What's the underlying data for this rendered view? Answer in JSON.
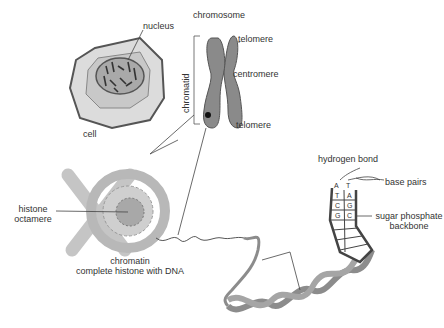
{
  "diagram": {
    "labels": {
      "nucleus": "nucleus",
      "cell": "cell",
      "chromosome": "chromosome",
      "chromatid": "chromatid",
      "telomere_top": "telomere",
      "centromere": "centromere",
      "telomere_bottom": "telomere",
      "histone_line1": "histone",
      "histone_line2": "octamere",
      "chromatin_line1": "chromatin",
      "chromatin_line2": "complete histone with DNA",
      "hydrogen_bond": "hydrogen bond",
      "base_pairs": "base pairs",
      "sugar_line1": "sugar phosphate",
      "sugar_line2": "backbone"
    },
    "base_pairs": [
      {
        "left": "A",
        "right": "T"
      },
      {
        "left": "T",
        "right": "A"
      },
      {
        "left": "C",
        "right": "G"
      },
      {
        "left": "G",
        "right": "C"
      }
    ],
    "colors": {
      "line": "#444444",
      "cell_fill": "#d9d9d9",
      "nucleus_fill": "#a8a8a8",
      "chromosome_fill": "#8c8c8c",
      "dna_fill": "#bdbdbd"
    }
  }
}
